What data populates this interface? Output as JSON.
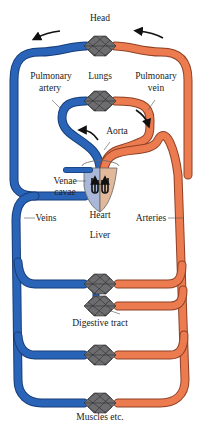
{
  "diagram": {
    "type": "circulatory-system-schematic",
    "colors": {
      "deoxygenated": "#2a64b8",
      "oxygenated": "#ec7b4f",
      "heart_right": "#a9b8d8",
      "heart_left": "#e2b89a",
      "capillary": "#555555"
    },
    "labels": {
      "head": "Head",
      "lungs": "Lungs",
      "pulmonary_artery": "Pulmonary artery",
      "pulmonary_artery_l1": "Pulmonary",
      "pulmonary_artery_l2": "artery",
      "pulmonary_vein_l1": "Pulmonary",
      "pulmonary_vein_l2": "vein",
      "aorta": "Aorta",
      "venae_cavae_l1": "Venae",
      "venae_cavae_l2": "cavae",
      "heart": "Heart",
      "veins": "Veins",
      "arteries": "Arteries",
      "liver": "Liver",
      "digestive_tract": "Digestive tract",
      "muscles": "Muscles etc."
    },
    "capillary_beds": [
      "Head",
      "Lungs",
      "Liver",
      "Digestive tract",
      "Unlabeled organ",
      "Muscles etc."
    ],
    "flow_arrows": [
      "head-left",
      "head-right",
      "aorta-up",
      "pulmonary-vein-down"
    ]
  }
}
